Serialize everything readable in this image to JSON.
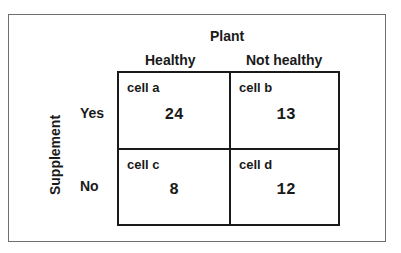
{
  "title": "Plant",
  "columns": [
    "Healthy",
    "Not healthy"
  ],
  "row_axis_label": "Supplement",
  "rows": [
    "Yes",
    "No"
  ],
  "cells": [
    {
      "name": "cell a",
      "value": "24"
    },
    {
      "name": "cell b",
      "value": "13"
    },
    {
      "name": "cell c",
      "value": "8"
    },
    {
      "name": "cell d",
      "value": "12"
    }
  ]
}
